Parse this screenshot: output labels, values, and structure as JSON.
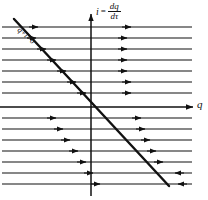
{
  "figure": {
    "background_color": "#ffffff",
    "stroke_color": "#111111"
  },
  "axes": {
    "horizontal": {
      "label": "q",
      "name": "charge-axis",
      "y": 107,
      "x_start": 0,
      "x_end": 193,
      "arrow": "right"
    },
    "vertical": {
      "label_lhs": "i",
      "label_eq": "=",
      "label_numerator": "dq",
      "label_denominator": "dτ",
      "name": "current-axis",
      "x": 91,
      "y_start": 14,
      "y_end": 196,
      "arrow": "up"
    }
  },
  "nullcline": {
    "label": "q",
    "label_plus": "+",
    "label_i": "i",
    "label_eq": "=",
    "label_zero": "0",
    "full_label": "q + i = 0",
    "x1": 14,
    "y1": 19,
    "x2": 169,
    "y2": 186,
    "slope": -1,
    "stroke_width": 2.4
  },
  "chart_data": {
    "type": "line",
    "xlabel": "q",
    "ylabel": "i = dq/dτ",
    "grid": false,
    "legend": "none",
    "axis_origin": [
      91,
      107
    ],
    "xlim": [
      0,
      208
    ],
    "ylim": [
      200,
      0
    ],
    "flow_lines": [
      {
        "y": 27,
        "x_start": 2,
        "x_end": 192,
        "arrow_x": 38,
        "arrow_dir": "right"
      },
      {
        "y": 38,
        "x_start": 2,
        "x_end": 192,
        "arrow_x": 36,
        "arrow_dir": "right"
      },
      {
        "y": 49,
        "x_start": 2,
        "x_end": 192,
        "arrow_x": 46,
        "arrow_dir": "right"
      },
      {
        "y": 60,
        "x_start": 2,
        "x_end": 192,
        "arrow_x": 56,
        "arrow_dir": "right"
      },
      {
        "y": 71,
        "x_start": 2,
        "x_end": 192,
        "arrow_x": 66,
        "arrow_dir": "right"
      },
      {
        "y": 82,
        "x_start": 2,
        "x_end": 192,
        "arrow_x": 76,
        "arrow_dir": "right"
      },
      {
        "y": 93,
        "x_start": 2,
        "x_end": 192,
        "arrow_x": 86,
        "arrow_dir": "right"
      },
      {
        "y": 107,
        "x_start": 0,
        "x_end": 193,
        "arrow_x": 138,
        "arrow_dir": "right"
      },
      {
        "y": 118,
        "x_start": 2,
        "x_end": 192,
        "arrow_x": 56,
        "arrow_dir": "right"
      },
      {
        "y": 129,
        "x_start": 2,
        "x_end": 192,
        "arrow_x": 63,
        "arrow_dir": "right"
      },
      {
        "y": 140,
        "x_start": 2,
        "x_end": 192,
        "arrow_x": 70,
        "arrow_dir": "right"
      },
      {
        "y": 151,
        "x_start": 2,
        "x_end": 192,
        "arrow_x": 78,
        "arrow_dir": "right"
      },
      {
        "y": 162,
        "x_start": 2,
        "x_end": 192,
        "arrow_x": 86,
        "arrow_dir": "right"
      },
      {
        "y": 173,
        "x_start": 2,
        "x_end": 192,
        "arrow_x": 93,
        "arrow_dir": "right"
      },
      {
        "y": 184,
        "x_start": 2,
        "x_end": 192,
        "arrow_x": 100,
        "arrow_dir": "right"
      }
    ],
    "secondary_arrows": [
      {
        "y": 27,
        "x": 131,
        "dir": "right"
      },
      {
        "y": 38,
        "x": 127,
        "dir": "right"
      },
      {
        "y": 49,
        "x": 127,
        "dir": "right"
      },
      {
        "y": 60,
        "x": 127,
        "dir": "right"
      },
      {
        "y": 71,
        "x": 127,
        "dir": "right"
      },
      {
        "y": 82,
        "x": 131,
        "dir": "right"
      },
      {
        "y": 93,
        "x": 131,
        "dir": "right"
      },
      {
        "y": 118,
        "x": 141,
        "dir": "right"
      },
      {
        "y": 129,
        "x": 145,
        "dir": "right"
      },
      {
        "y": 140,
        "x": 150,
        "dir": "right"
      },
      {
        "y": 151,
        "x": 156,
        "dir": "right"
      },
      {
        "y": 162,
        "x": 163,
        "dir": "right"
      },
      {
        "y": 173,
        "x": 175,
        "dir": "left"
      },
      {
        "y": 184,
        "x": 178,
        "dir": "left"
      }
    ]
  }
}
